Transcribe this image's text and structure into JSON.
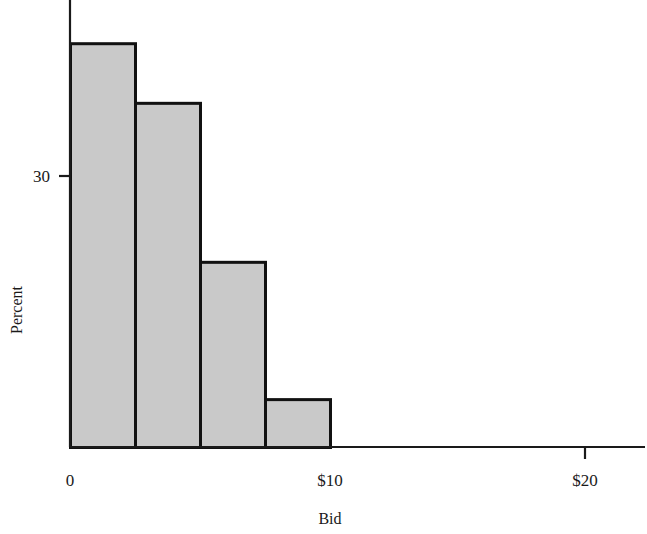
{
  "chart_data": {
    "type": "bar",
    "title": "",
    "subtitle": "",
    "xlabel": "Bid",
    "ylabel": "Percent",
    "categories": [
      "0-2.5",
      "2.5-5",
      "5-7.5",
      "7.5-10"
    ],
    "bin_edges": [
      0,
      2.5,
      5,
      7.5,
      10
    ],
    "values": [
      44.7,
      38.1,
      20.5,
      5.3
    ],
    "series": [
      {
        "name": "Percent",
        "values": [
          44.7,
          38.1,
          20.5,
          5.3
        ]
      }
    ],
    "xlim": [
      0,
      22.5
    ],
    "ylim": [
      0,
      50
    ],
    "x_tick_values": [
      0,
      10,
      20
    ],
    "x_tick_labels": [
      "0",
      "$10",
      "$20"
    ],
    "y_tick_values": [
      30
    ],
    "y_tick_labels": [
      "30"
    ],
    "grid": false,
    "legend": false,
    "legend_position": "none",
    "bar_fill_color": "#c9c9c9",
    "bar_edge_color": "#111111",
    "axis_color": "#1a1a1a",
    "annotations": []
  },
  "axes": {
    "x_title": "Bid",
    "y_title": "Percent",
    "x_ticks": [
      {
        "label": "0",
        "value": 0
      },
      {
        "label": "$10",
        "value": 10
      },
      {
        "label": "$20",
        "value": 20
      }
    ],
    "y_ticks": [
      {
        "label": "30",
        "value": 30
      }
    ]
  },
  "bars": [
    {
      "label": "0-2.5",
      "value": 44.7
    },
    {
      "label": "2.5-5",
      "value": 38.1
    },
    {
      "label": "5-7.5",
      "value": 20.5
    },
    {
      "label": "7.5-10",
      "value": 5.3
    }
  ]
}
